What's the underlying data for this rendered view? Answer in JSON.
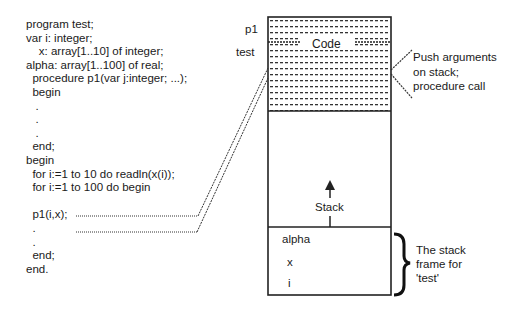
{
  "code": {
    "lines": [
      "program test;",
      "var i: integer;",
      "    x: array[1..10] of integer;",
      "alpha: array[1..100] of real;",
      "  procedure p1(var j:integer; ...);",
      "  begin",
      "   .",
      "   .",
      "   .",
      "  end;",
      "begin",
      "  for i:=1 to 10 do readln(x(i));",
      "  for i:=1 to 100 do begin",
      "",
      "  p1(i,x);",
      "  .",
      "  .",
      "  end;",
      "end."
    ]
  },
  "memory": {
    "label_p1": "p1",
    "label_test": "test",
    "code_label": "Code",
    "stack_label": "Stack",
    "frame_vars": [
      "alpha",
      "x",
      "i"
    ]
  },
  "annotations": {
    "push_line1": "Push arguments",
    "push_line2": "on stack;",
    "push_line3": "procedure call",
    "frame_line1": "The stack",
    "frame_line2": "frame for",
    "frame_line3": "'test'"
  }
}
